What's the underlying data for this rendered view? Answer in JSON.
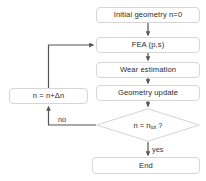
{
  "diagram": {
    "type": "flowchart",
    "colors": {
      "background": "#ffffff",
      "node_border": "#d6d6d6",
      "node_fill": "#ffffff",
      "text": "#2b2b2b",
      "connector": "#555555"
    }
  },
  "nodes": {
    "initial": {
      "label": "Initial geometry n=0",
      "shape": "rounded-rect"
    },
    "fea": {
      "label": "FEA (p,s)",
      "shape": "rounded-rect"
    },
    "wear": {
      "label": "Wear estimation",
      "shape": "rounded-rect"
    },
    "geometry": {
      "label": "Geometry update",
      "shape": "rounded-rect"
    },
    "increment": {
      "label": "n = n+Δn",
      "shape": "rounded-rect"
    },
    "decision": {
      "label_main": "n = n",
      "label_subscript": "tot",
      "label_suffix": " ?",
      "shape": "diamond"
    },
    "end": {
      "label": "End",
      "shape": "rounded-rect"
    }
  },
  "edge_labels": {
    "no": "no",
    "yes": "yes"
  },
  "edges": [
    {
      "from": "initial",
      "to": "fea",
      "label": ""
    },
    {
      "from": "fea",
      "to": "wear",
      "label": ""
    },
    {
      "from": "wear",
      "to": "geometry",
      "label": ""
    },
    {
      "from": "geometry",
      "to": "decision",
      "label": ""
    },
    {
      "from": "decision",
      "to": "increment",
      "label": "no"
    },
    {
      "from": "increment",
      "to": "fea",
      "label": ""
    },
    {
      "from": "decision",
      "to": "end",
      "label": "yes"
    }
  ]
}
